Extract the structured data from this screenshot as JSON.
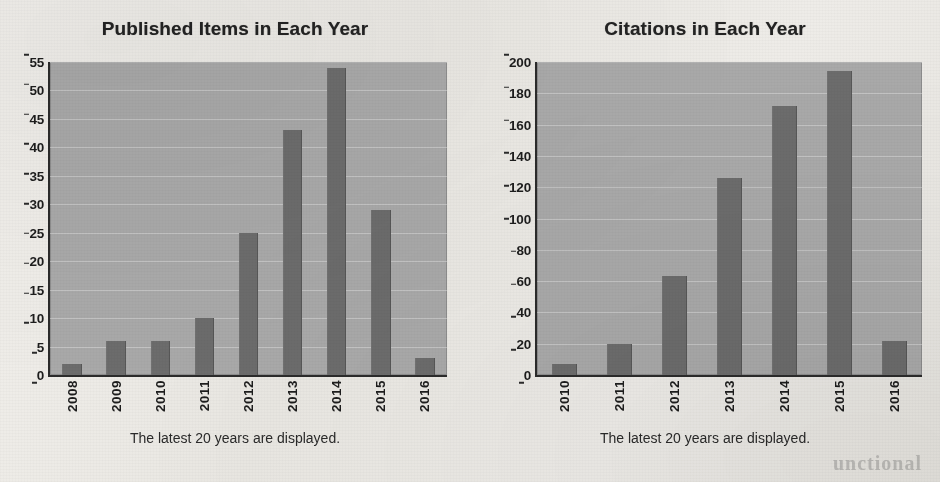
{
  "document": {
    "kind": "scanned-page",
    "paper_color": "#eeece8"
  },
  "colors": {
    "plot_background": "#a9a9a9",
    "bar_fill": "#6c6c6c",
    "axis": "#2b2b2b",
    "text": "#1d1d1d",
    "gridline": "#e2e2e2"
  },
  "ghost_text": {
    "bleed_through": "unctional"
  },
  "panels": [
    {
      "id": "published-items",
      "title": "Published Items in Each Year",
      "caption": "The latest 20 years are displayed."
    },
    {
      "id": "citations",
      "title": "Citations in Each Year",
      "caption": "The latest 20 years are displayed."
    }
  ],
  "chart_data": [
    {
      "type": "bar",
      "id": "published-items",
      "title": "Published Items in Each Year",
      "xlabel": "",
      "ylabel": "",
      "categories": [
        "2008",
        "2009",
        "2010",
        "2011",
        "2012",
        "2013",
        "2014",
        "2015",
        "2016"
      ],
      "values": [
        2,
        6,
        6,
        10,
        25,
        43,
        54,
        29,
        3
      ],
      "ylim": [
        0,
        55
      ],
      "ytick_step": 5,
      "yticks": [
        0,
        5,
        10,
        15,
        20,
        25,
        30,
        35,
        40,
        45,
        50,
        55
      ],
      "ytick_labels": [
        "0",
        "5",
        "10",
        "15",
        "20",
        "25",
        "30",
        "35",
        "40",
        "45",
        "50",
        "55"
      ],
      "grid": true,
      "legend": null,
      "annotation": "The latest 20 years are displayed."
    },
    {
      "type": "bar",
      "id": "citations",
      "title": "Citations in Each Year",
      "xlabel": "",
      "ylabel": "",
      "categories": [
        "2010",
        "2011",
        "2012",
        "2013",
        "2014",
        "2015",
        "2016"
      ],
      "values": [
        7,
        20,
        63,
        126,
        172,
        194,
        22
      ],
      "ylim": [
        0,
        200
      ],
      "ytick_step": 20,
      "yticks": [
        0,
        20,
        40,
        60,
        80,
        100,
        120,
        140,
        160,
        180,
        200
      ],
      "ytick_labels": [
        "0",
        "20",
        "40",
        "60",
        "80",
        "100",
        "120",
        "140",
        "160",
        "180",
        "200"
      ],
      "grid": true,
      "legend": null,
      "annotation": "The latest 20 years are displayed."
    }
  ]
}
